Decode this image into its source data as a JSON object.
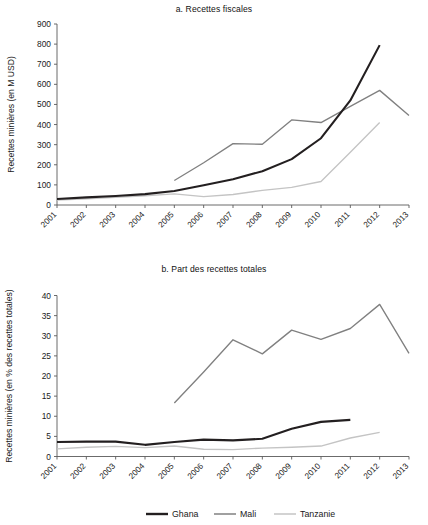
{
  "figure": {
    "panels": [
      {
        "id": "a",
        "title": "a. Recettes fiscales"
      },
      {
        "id": "b",
        "title": "b. Part des recettes totales"
      }
    ]
  },
  "legend": {
    "position": "bottom-center",
    "entries": [
      {
        "label": "Ghana",
        "color": "#231f20"
      },
      {
        "label": "Mali",
        "color": "#808080"
      },
      {
        "label": "Tanzanie",
        "color": "#c4c4c4"
      }
    ]
  },
  "chart_data": [
    {
      "type": "line",
      "title": "a. Recettes fiscales",
      "xlabel": "",
      "ylabel": "Recettes minières (en M USD)",
      "x": [
        2001,
        2002,
        2003,
        2004,
        2005,
        2006,
        2007,
        2008,
        2009,
        2010,
        2011,
        2012,
        2013
      ],
      "xticklabels": [
        "2001",
        "2002",
        "2003",
        "2004",
        "2005",
        "2006",
        "2007",
        "2008",
        "2009",
        "2010",
        "2011",
        "2012",
        "2013"
      ],
      "yticks": [
        0,
        100,
        200,
        300,
        400,
        500,
        600,
        700,
        800,
        900
      ],
      "ylim": [
        0,
        900
      ],
      "grid": false,
      "legend_position": "bottom-center",
      "series": [
        {
          "name": "Ghana",
          "color": "#231f20",
          "x": [
            2001,
            2002,
            2003,
            2004,
            2005,
            2006,
            2007,
            2008,
            2009,
            2010,
            2011,
            2012
          ],
          "values": [
            30,
            38,
            45,
            54,
            70,
            98,
            128,
            168,
            228,
            332,
            520,
            795
          ]
        },
        {
          "name": "Mali",
          "color": "#808080",
          "x": [
            2005,
            2006,
            2007,
            2008,
            2009,
            2010,
            2011,
            2012,
            2013
          ],
          "values": [
            122,
            210,
            305,
            302,
            423,
            410,
            490,
            570,
            445
          ]
        },
        {
          "name": "Tanzanie",
          "color": "#c4c4c4",
          "x": [
            2001,
            2002,
            2003,
            2004,
            2005,
            2006,
            2007,
            2008,
            2009,
            2010,
            2011,
            2012
          ],
          "values": [
            25,
            31,
            38,
            46,
            55,
            42,
            52,
            73,
            88,
            117,
            262,
            410
          ]
        }
      ]
    },
    {
      "type": "line",
      "title": "b. Part des recettes totales",
      "xlabel": "",
      "ylabel": "Recettes minières (en % des recettes totales)",
      "x": [
        2001,
        2002,
        2003,
        2004,
        2005,
        2006,
        2007,
        2008,
        2009,
        2010,
        2011,
        2012,
        2013
      ],
      "xticklabels": [
        "2001",
        "2002",
        "2003",
        "2004",
        "2005",
        "2006",
        "2007",
        "2008",
        "2009",
        "2010",
        "2011",
        "2012",
        "2013"
      ],
      "yticks": [
        0,
        5,
        10,
        15,
        20,
        25,
        30,
        35,
        40
      ],
      "ylim": [
        0,
        40
      ],
      "grid": false,
      "legend_position": "bottom-center",
      "series": [
        {
          "name": "Ghana",
          "color": "#231f20",
          "x": [
            2001,
            2002,
            2003,
            2004,
            2005,
            2006,
            2007,
            2008,
            2009,
            2010,
            2011
          ],
          "values": [
            3.6,
            3.7,
            3.7,
            2.9,
            3.6,
            4.2,
            4.0,
            4.4,
            6.9,
            8.6,
            9.1
          ]
        },
        {
          "name": "Mali",
          "color": "#808080",
          "x": [
            2005,
            2006,
            2007,
            2008,
            2009,
            2010,
            2011,
            2012,
            2013
          ],
          "values": [
            13.3,
            21.0,
            29.0,
            25.5,
            31.4,
            29.1,
            31.8,
            37.8,
            25.6
          ]
        },
        {
          "name": "Tanzanie",
          "color": "#c4c4c4",
          "x": [
            2001,
            2002,
            2003,
            2004,
            2005,
            2006,
            2007,
            2008,
            2009,
            2010,
            2011,
            2012
          ],
          "values": [
            1.9,
            2.3,
            2.5,
            2.2,
            2.6,
            1.8,
            1.7,
            2.1,
            2.3,
            2.6,
            4.6,
            6.0
          ]
        }
      ]
    }
  ]
}
